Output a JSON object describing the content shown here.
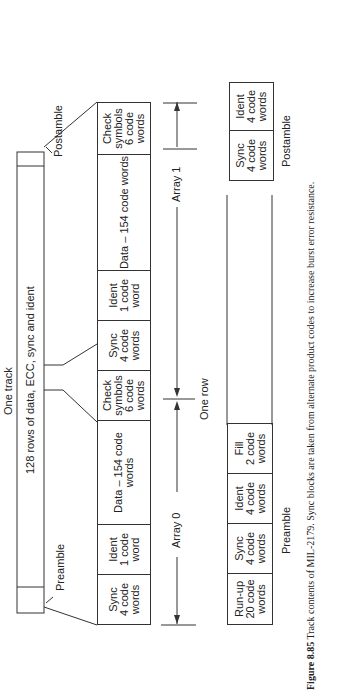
{
  "track": {
    "title": "One track",
    "main_label": "128 rows of data, ECC, sync and ident",
    "preamble_label": "Preamble",
    "postamble_label": "Postamble"
  },
  "row": {
    "cells": [
      "Sync\n4 code\nwords",
      "Ident\n1 code\nword",
      "Data – 154 code words",
      "Check\nsymbols\n6 code\nwords",
      "Sync\n4 code\nwords",
      "Ident\n1 code\nword",
      "Data – 154 code words",
      "Check\nsymbols\n6 code\nwords"
    ],
    "array0_label": "Array 0",
    "array1_label": "Array 1",
    "one_row_label": "One row"
  },
  "preamble": {
    "cells": [
      "Run-up\n20 code\nwords",
      "Sync\n4 code\nwords",
      "Ident\n4 code\nwords",
      "Fill\n2 code\nwords"
    ],
    "label": "Preamble"
  },
  "postamble": {
    "cells": [
      "Sync\n4 code\nwords",
      "Ident\n4 code\nwords"
    ],
    "label": "Postamble"
  },
  "caption": {
    "figure": "Figure 8.85",
    "text": " Track contents of MIL-2179. Sync blocks are taken from alternate product codes to increase burst error resistance."
  }
}
